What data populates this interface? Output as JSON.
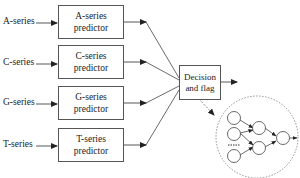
{
  "inputs": [
    {
      "label": "A-series"
    },
    {
      "label": "C-series"
    },
    {
      "label": "G-series"
    },
    {
      "label": "T-series"
    }
  ],
  "predictors": [
    {
      "line1": "A-series",
      "line2": "predictor"
    },
    {
      "line1": "C-series",
      "line2": "predictor"
    },
    {
      "line1": "G-series",
      "line2": "predictor"
    },
    {
      "line1": "T-series",
      "line2": "predictor"
    }
  ],
  "decision": {
    "line1": "Decision",
    "line2": "and flag"
  },
  "detail": {
    "type": "neural-network-inset",
    "input_nodes": 3,
    "hidden_nodes": 2,
    "output_nodes": 1,
    "ellipsis": "......"
  },
  "colors": {
    "line": "#444444",
    "dashed": "#777777"
  }
}
